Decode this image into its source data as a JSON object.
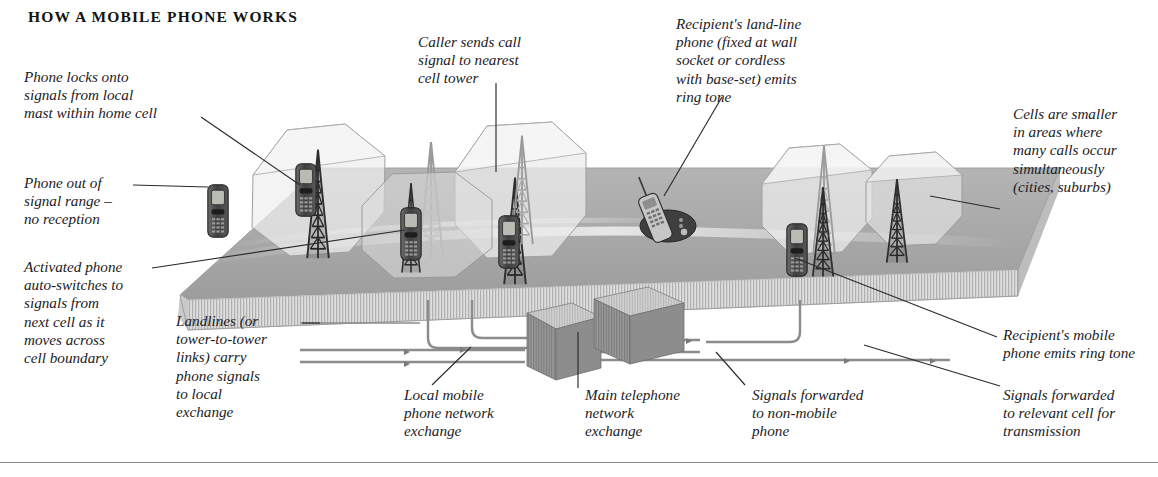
{
  "page": {
    "title": "HOW A MOBILE PHONE WORKS",
    "width": 1158,
    "height": 477
  },
  "colors": {
    "ground_top": "#a9a9a9",
    "ground_edge": "#d6d6d6",
    "cell_fill": "#e8e8e8",
    "cell_stroke": "#9a9a9a",
    "tower_dark": "#3b3b3b",
    "tower_light": "#b9b9b9",
    "cable": "#8c8c8c",
    "leader_line": "#2b2b2b",
    "text": "#22211f",
    "rule": "#8d8d8d"
  },
  "labels": {
    "phone_locks": "Phone locks onto\nsignals from local\nmast within home cell",
    "caller_sends": "Caller sends call\nsignal to nearest\ncell tower",
    "recipient_landline": "Recipient's land-line\nphone (fixed at wall\nsocket or cordless\nwith base-set) emits\nring tone",
    "cells_smaller": "Cells are smaller\nin areas where\nmany calls occur\nsimultaneously\n(cities, suburbs)",
    "phone_out_of_range": "Phone out of\nsignal range –\nno reception",
    "activated_phone": "Activated phone\nauto-switches to\nsignals from\nnext cell as it\nmoves across\ncell boundary",
    "landlines": "Landlines (or\ntower-to-tower\nlinks) carry\nphone signals\nto local\nexchange",
    "local_mobile_exchange": "Local mobile\nphone network\nexchange",
    "main_telephone_exchange": "Main telephone\nnetwork\nexchange",
    "signals_non_mobile": "Signals forwarded\nto non-mobile\nphone",
    "recipient_mobile": "Recipient's mobile\nphone emits ring tone",
    "signals_relevant_cell": "Signals forwarded\nto relevant cell for\ntransmission"
  },
  "scene": {
    "elements": [
      {
        "name": "ground-platform",
        "kind": "platform"
      },
      {
        "name": "cell-1",
        "kind": "octagon-cell"
      },
      {
        "name": "cell-2",
        "kind": "octagon-cell"
      },
      {
        "name": "cell-3",
        "kind": "octagon-cell"
      },
      {
        "name": "cell-4",
        "kind": "octagon-cell"
      },
      {
        "name": "cell-5",
        "kind": "octagon-cell"
      },
      {
        "name": "cell-tower-1",
        "kind": "mast"
      },
      {
        "name": "cell-tower-2",
        "kind": "mast"
      },
      {
        "name": "cell-tower-3",
        "kind": "mast"
      },
      {
        "name": "cell-tower-4",
        "kind": "mast"
      },
      {
        "name": "cell-tower-5",
        "kind": "mast"
      },
      {
        "name": "mobile-phone-out-of-range",
        "kind": "mobile-phone"
      },
      {
        "name": "mobile-phone-caller",
        "kind": "mobile-phone"
      },
      {
        "name": "mobile-phone-switching",
        "kind": "mobile-phone"
      },
      {
        "name": "mobile-phone-recipient",
        "kind": "mobile-phone"
      },
      {
        "name": "cordless-landline-phone",
        "kind": "landline-phone"
      },
      {
        "name": "local-mobile-exchange-box",
        "kind": "exchange-box"
      },
      {
        "name": "main-telephone-exchange-box",
        "kind": "exchange-box"
      }
    ]
  }
}
